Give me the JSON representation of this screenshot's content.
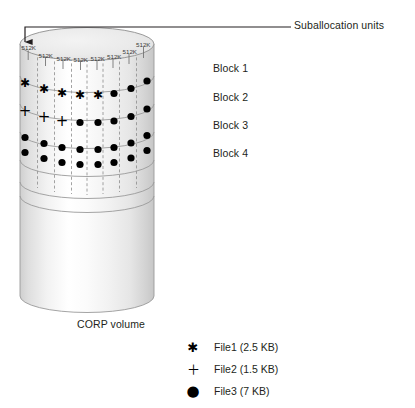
{
  "figure": {
    "callout": {
      "label": "Suballocation units",
      "arrow_target_x": 25,
      "arrow_target_y": 44
    },
    "volume_label": "CORP volume",
    "unit_label": "512K",
    "unit_count": 8,
    "unit_labels": [
      "512K",
      "512K",
      "512K",
      "512K",
      "512K",
      "512K",
      "512K",
      "512K"
    ],
    "blocks": [
      {
        "label": "Block 1",
        "markers": [
          "asterisk",
          "asterisk",
          "asterisk",
          "asterisk",
          "asterisk",
          "dot",
          "dot",
          "dot"
        ]
      },
      {
        "label": "Block 2",
        "markers": [
          "plus",
          "plus",
          "plus",
          "dot",
          "dot",
          "dot",
          "dot",
          "dot"
        ]
      },
      {
        "label": "Block 3",
        "markers": [
          "dot",
          "dot",
          "dot",
          "dot",
          "dot",
          "dot",
          "dot",
          "dot"
        ]
      },
      {
        "label": "Block 4",
        "markers": [
          "dot",
          "dot",
          "dot",
          "dot",
          "dot",
          "dot",
          "dot",
          "dot"
        ]
      }
    ],
    "empty_band_count": 2,
    "legend": [
      {
        "glyph": "asterisk-marker",
        "symbol": "✱",
        "text": "File1 (2.5 KB)"
      },
      {
        "glyph": "plus-marker",
        "symbol": "＋",
        "text": "File2 (1.5 KB)"
      },
      {
        "glyph": "dot-marker",
        "symbol": "●",
        "text": "File3 (7 KB)"
      }
    ],
    "colors": {
      "ink": "#231f20",
      "marker": "#000000",
      "outline": "#808080",
      "divider": "#808080",
      "cylinder_light": "#fdfdfd",
      "cylinder_mid": "#f0f0f0",
      "cylinder_dark": "#d8d8d8",
      "top_face": "#e8e8e8"
    }
  }
}
